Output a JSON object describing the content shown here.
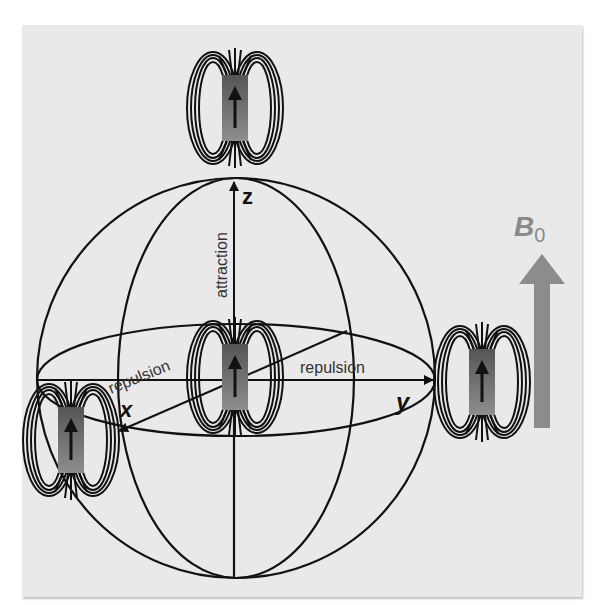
{
  "figure": {
    "background_color": "#e9e9e9",
    "line_color": "#111111",
    "magnet_color_top": "#5a5a5a",
    "magnet_color_bottom": "#8a8a8a",
    "field_arrow_color": "#8c8c8c"
  },
  "axes": {
    "x_label": "x",
    "y_label": "y",
    "z_label": "z"
  },
  "annotations": {
    "z_axis": "attraction",
    "x_axis": "repulsion",
    "y_axis": "repulsion"
  },
  "field": {
    "symbol": "B",
    "subscript": "0"
  },
  "magnets": [
    {
      "position": "top",
      "orientation": "up"
    },
    {
      "position": "center",
      "orientation": "up"
    },
    {
      "position": "right",
      "orientation": "up"
    },
    {
      "position": "lower-left",
      "orientation": "up"
    }
  ]
}
